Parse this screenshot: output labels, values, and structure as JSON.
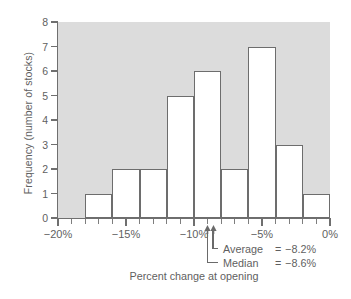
{
  "chart_data": {
    "type": "bar",
    "title": "",
    "subtitle": "",
    "xlabel": "Percent change at opening",
    "ylabel": "Frequency (number of stocks)",
    "categories": [
      "-18% to -16%",
      "-16% to -14%",
      "-14% to -12%",
      "-12% to -10%",
      "-10% to -8%",
      "-8% to -6%",
      "-6% to -4%",
      "-4% to -2%",
      "-2% to 0%"
    ],
    "bin_edges": [
      -18,
      -16,
      -14,
      -12,
      -10,
      -8,
      -6,
      -4,
      -2,
      0
    ],
    "values": [
      1,
      2,
      2,
      5,
      6,
      2,
      7,
      3,
      1
    ],
    "xlim": [
      -20,
      0
    ],
    "ylim": [
      0,
      8
    ],
    "grid": false,
    "legend": "none",
    "x_tick_labels": [
      "-20%",
      "-15%",
      "-10%",
      "-5%",
      "0%"
    ],
    "x_tick_values": [
      -20,
      -15,
      -10,
      -5,
      0
    ],
    "x_minor_tick_step": 1,
    "y_tick_labels": [
      "0",
      "1",
      "2",
      "3",
      "4",
      "5",
      "6",
      "7",
      "8"
    ],
    "y_tick_values": [
      0,
      1,
      2,
      3,
      4,
      5,
      6,
      7,
      8
    ],
    "annotations": [
      {
        "name": "average",
        "label": "Average",
        "equals": "=",
        "value": "−8.2%",
        "x": -8.6
      },
      {
        "name": "median",
        "label": "Median",
        "equals": "=",
        "value": "−8.6%",
        "x": -9.0
      }
    ],
    "colors": {
      "plot_background": "#dcdcdc",
      "bar_fill": "#ffffff",
      "bar_edge": "#6d6d6d",
      "axis": "#6f6f6f",
      "text": "#5f5f5f",
      "page_background": "#ffffff"
    }
  }
}
